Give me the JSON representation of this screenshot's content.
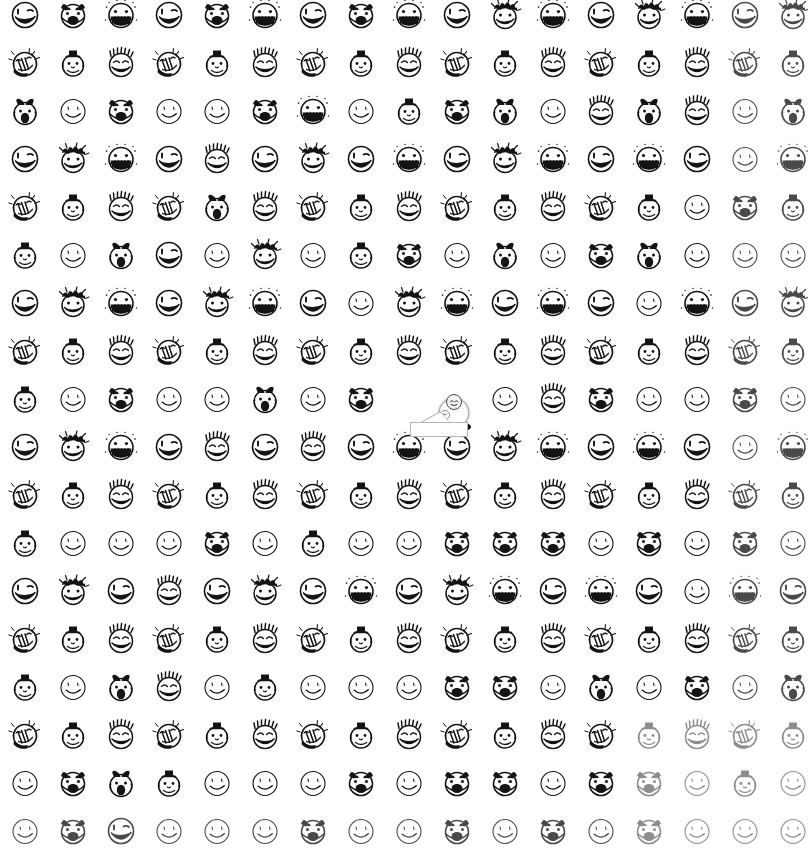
{
  "canvas": {
    "width": 808,
    "height": 865,
    "background": "#ffffff",
    "ink": "#141414",
    "faded_ink": "#8d8d8d"
  },
  "grid": {
    "columns": 17,
    "rows": 18,
    "cell_pitch_x": 48,
    "cell_pitch_y": 48,
    "origin_x": 1,
    "origin_y": -9,
    "description": "Dense repeating grid of hand-drawn doodle smiley faces"
  },
  "face_types": [
    {
      "id": "grin-wink",
      "name": "winking open grin face"
    },
    {
      "id": "devil",
      "name": "devil horns open mouth face"
    },
    {
      "id": "teeth",
      "name": "big toothy grin face with sparkles"
    },
    {
      "id": "slap",
      "name": "tilted face with hand slap and motion marks"
    },
    {
      "id": "tophat",
      "name": "face wearing small top hat"
    },
    {
      "id": "spiky",
      "name": "spiky haired closed-eye smiling face"
    },
    {
      "id": "simple",
      "name": "plain thin outline smiley"
    },
    {
      "id": "messy",
      "name": "messy scribble haired laughing face"
    },
    {
      "id": "bow",
      "name": "face with bow and open round mouth"
    },
    {
      "id": "crown",
      "name": "crown haired winking face"
    }
  ],
  "pattern": [
    [
      0,
      1,
      2,
      0,
      1,
      2,
      0,
      1,
      2,
      0,
      7,
      2,
      0,
      7,
      2,
      0,
      7
    ],
    [
      3,
      4,
      5,
      3,
      4,
      5,
      3,
      4,
      5,
      3,
      4,
      5,
      3,
      4,
      5,
      3,
      4
    ],
    [
      8,
      6,
      1,
      6,
      6,
      1,
      2,
      6,
      4,
      1,
      8,
      6,
      5,
      8,
      5,
      6,
      8
    ],
    [
      0,
      7,
      2,
      0,
      5,
      0,
      7,
      0,
      2,
      0,
      7,
      2,
      0,
      2,
      0,
      6,
      2
    ],
    [
      3,
      4,
      5,
      3,
      8,
      5,
      3,
      4,
      5,
      3,
      4,
      5,
      3,
      4,
      6,
      1,
      4
    ],
    [
      4,
      6,
      8,
      0,
      6,
      7,
      6,
      4,
      1,
      6,
      8,
      6,
      1,
      8,
      6,
      6,
      6
    ],
    [
      0,
      7,
      2,
      0,
      7,
      2,
      0,
      6,
      7,
      2,
      0,
      2,
      0,
      6,
      2,
      0,
      7
    ],
    [
      3,
      4,
      5,
      3,
      4,
      5,
      3,
      4,
      5,
      3,
      4,
      5,
      3,
      4,
      5,
      3,
      4
    ],
    [
      4,
      6,
      1,
      6,
      6,
      8,
      6,
      1,
      6,
      1,
      6,
      5,
      1,
      6,
      6,
      1,
      6
    ],
    [
      0,
      7,
      2,
      0,
      5,
      0,
      5,
      0,
      2,
      0,
      7,
      2,
      0,
      2,
      0,
      6,
      2
    ],
    [
      3,
      4,
      5,
      3,
      4,
      5,
      3,
      4,
      5,
      3,
      4,
      5,
      3,
      4,
      5,
      3,
      4
    ],
    [
      4,
      6,
      6,
      6,
      1,
      6,
      4,
      6,
      6,
      1,
      1,
      1,
      6,
      1,
      6,
      1,
      6
    ],
    [
      0,
      7,
      0,
      5,
      0,
      7,
      0,
      2,
      0,
      7,
      2,
      0,
      2,
      0,
      6,
      2,
      0
    ],
    [
      3,
      4,
      5,
      3,
      4,
      5,
      3,
      4,
      5,
      3,
      4,
      5,
      3,
      4,
      5,
      3,
      4
    ],
    [
      4,
      6,
      8,
      5,
      6,
      4,
      6,
      6,
      6,
      1,
      1,
      6,
      8,
      6,
      1,
      6,
      8
    ],
    [
      3,
      4,
      5,
      3,
      4,
      5,
      3,
      4,
      5,
      3,
      4,
      5,
      3,
      4,
      5,
      3,
      4
    ],
    [
      6,
      1,
      8,
      4,
      6,
      6,
      6,
      1,
      6,
      1,
      1,
      6,
      1,
      1,
      6,
      4,
      6
    ],
    [
      6,
      1,
      0,
      6,
      6,
      6,
      1,
      6,
      6,
      1,
      6,
      1,
      6,
      1,
      6,
      6,
      6
    ]
  ],
  "fade": {
    "note": "strokes become progressively lighter toward the bottom-right of the sheet",
    "light_threshold_x": 600,
    "light_threshold_y": 700
  },
  "hover_item": {
    "name": "magnified-hovered-face",
    "x": 410,
    "y": 392,
    "description": "One grid cell replaced by a magnified 3D orb-like face with a drop shadow and a leader line pointing to a small white callout box",
    "callout": {
      "visible": true,
      "border_color": "#b4b4b4",
      "background": "#ffffff",
      "lines": [
        "",
        ""
      ],
      "text_legible": false,
      "note": "micro text in the callout is below legible resolution in the source image"
    }
  }
}
